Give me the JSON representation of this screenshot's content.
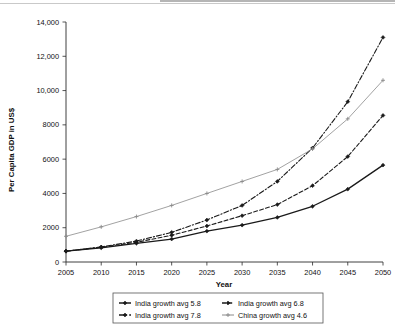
{
  "chart_data": {
    "type": "line",
    "title": "",
    "xlabel": "Year",
    "ylabel": "Per Capita GDP in US$",
    "x": [
      2005,
      2010,
      2015,
      2020,
      2025,
      2030,
      2035,
      2040,
      2045,
      2050
    ],
    "xlim": [
      2005,
      2050
    ],
    "ylim": [
      0,
      14000
    ],
    "xticks": [
      "2005",
      "2010",
      "2015",
      "2020",
      "2025",
      "2030",
      "2035",
      "2040",
      "2045",
      "2050"
    ],
    "yticks": [
      "0",
      "2000",
      "4000",
      "6000",
      "8000",
      "10,000",
      "12,000",
      "14,000"
    ],
    "ytick_values": [
      0,
      2000,
      4000,
      6000,
      8000,
      10000,
      12000,
      14000
    ],
    "grid": false,
    "legend_position": "bottom",
    "series": [
      {
        "name": "India growth avg  5.8",
        "style": "solid",
        "color": "#1a1a1a",
        "width": 1.3,
        "marker": "diamond",
        "values": [
          630,
          830,
          1090,
          1340,
          1800,
          2150,
          2600,
          3250,
          4250,
          5650
        ]
      },
      {
        "name": "India growth avg  6.8",
        "style": "dashed",
        "color": "#1a1a1a",
        "width": 1.1,
        "marker": "diamond",
        "values": [
          630,
          860,
          1150,
          1560,
          2100,
          2700,
          3350,
          4450,
          6150,
          8550
        ]
      },
      {
        "name": "India growth avg  7.8",
        "style": "dashdot",
        "color": "#1a1a1a",
        "width": 1.1,
        "marker": "diamond",
        "values": [
          630,
          880,
          1220,
          1730,
          2450,
          3300,
          4700,
          6650,
          9350,
          13100
        ]
      },
      {
        "name": "China growth avg 4.6",
        "style": "solid",
        "color": "#8a8a8a",
        "width": 0.8,
        "marker": "plus",
        "values": [
          1500,
          2050,
          2650,
          3300,
          4000,
          4700,
          5400,
          6600,
          8350,
          10600
        ]
      }
    ]
  },
  "legend": {
    "entries": [
      {
        "label": "India growth avg  5.8",
        "marker": "line-diamond-solid"
      },
      {
        "label": "India growth avg  6.8",
        "marker": "line-diamond-dashed"
      },
      {
        "label": "India growth avg  7.8",
        "marker": "line-diamond-dashdot"
      },
      {
        "label": "China growth avg 4.6",
        "marker": "line-plus-gray"
      }
    ]
  }
}
